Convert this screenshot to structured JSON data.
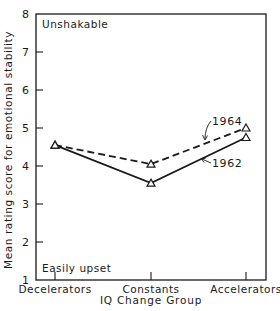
{
  "chart_data": {
    "type": "line",
    "title": "",
    "xlabel": "IQ Change Group",
    "ylabel": "Mean rating score for emotional stability",
    "categories": [
      "Decelerators",
      "Constants",
      "Accelerators"
    ],
    "ylim": [
      1,
      8
    ],
    "yticks": [
      "1",
      "2",
      "3",
      "4",
      "5",
      "6",
      "7",
      "8"
    ],
    "grid": false,
    "legend": "inline labels with arrows",
    "series": [
      {
        "name": "1962",
        "style": "solid",
        "marker": "triangle",
        "values": [
          4.55,
          3.55,
          4.75
        ]
      },
      {
        "name": "1964",
        "style": "dashed",
        "marker": "triangle",
        "values": [
          4.55,
          4.05,
          5.0
        ]
      }
    ],
    "annotations": {
      "top": "Unshakable",
      "bottom": "Easily upset"
    }
  },
  "colors": {
    "ink": "#1a1a1a",
    "background": "#ffffff"
  }
}
